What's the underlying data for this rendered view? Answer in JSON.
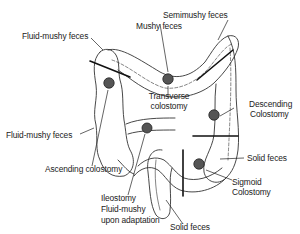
{
  "diagram": {
    "type": "anatomical illustration of colon with stoma sites",
    "labels": {
      "mushy": "Mushy feces",
      "semimushy": "Semimushy feces",
      "fluid_mushy_top": "Fluid-mushy feces",
      "transverse_1": "Transverse",
      "transverse_2": "colostomy",
      "descending_1": "Descending",
      "descending_2": "Colostomy",
      "fluid_mushy_left": "Fluid-mushy feces",
      "ascending": "Ascending colostomy",
      "solid_right": "Solid feces",
      "sigmoid_1": "Sigmoid",
      "sigmoid_2": "Colostomy",
      "ileostomy_1": "Ileostomy",
      "ileostomy_2": "Fluid-mushy",
      "ileostomy_3": "upon adaptation",
      "solid_bottom": "Solid feces"
    },
    "colors": {
      "line": "#222222",
      "stoma": "#555555",
      "background": "#ffffff"
    }
  }
}
